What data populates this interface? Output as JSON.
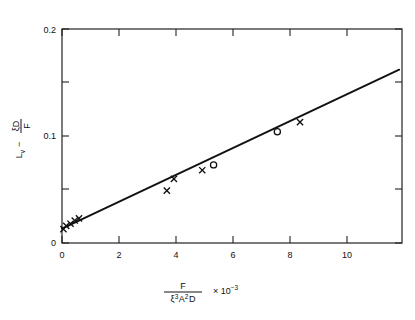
{
  "chart_data": {
    "type": "scatter",
    "title": "",
    "subtitle": "",
    "xlabel": "F / (ξ³A²D)  × 10⁻³",
    "ylabel": "L_v − ξD/F",
    "xlabel_parts": {
      "numerator": "F",
      "denominator_xi": "ξ",
      "denominator_xi_exp": "3",
      "denominator_A": "A",
      "denominator_A_exp": "2",
      "denominator_D": "D",
      "multiplier": "× 10",
      "multiplier_exp": "−3"
    },
    "ylabel_parts": {
      "lead": "L",
      "lead_sub": "v",
      "minus": "−",
      "frac_num_xi": "ξ",
      "frac_num_D": "D",
      "frac_den": "F"
    },
    "xlim": [
      0,
      12
    ],
    "ylim": [
      0,
      0.2
    ],
    "xticks": [
      0,
      2,
      4,
      6,
      8,
      10
    ],
    "xticklabels": [
      "0",
      "2",
      "4",
      "6",
      "8",
      "10"
    ],
    "xticks_minor": [
      1,
      3,
      5,
      7,
      9,
      11
    ],
    "yticks": [
      0,
      0.1,
      0.2
    ],
    "yticklabels": [
      "0",
      "0.1",
      "0.2"
    ],
    "yticks_minor": [
      0.05,
      0.15
    ],
    "grid": false,
    "legend": false,
    "frame": true,
    "series": [
      {
        "name": "cross-markers",
        "marker": "x",
        "color": "#111111",
        "points": [
          {
            "x": 0.05,
            "y": 0.013
          },
          {
            "x": 0.15,
            "y": 0.016
          },
          {
            "x": 0.3,
            "y": 0.018
          },
          {
            "x": 0.45,
            "y": 0.021
          },
          {
            "x": 0.6,
            "y": 0.023
          },
          {
            "x": 3.7,
            "y": 0.049
          },
          {
            "x": 3.95,
            "y": 0.06
          },
          {
            "x": 4.95,
            "y": 0.068
          },
          {
            "x": 8.4,
            "y": 0.113
          }
        ]
      },
      {
        "name": "open-circle-markers",
        "marker": "o",
        "color": "#111111",
        "points": [
          {
            "x": 5.35,
            "y": 0.073
          },
          {
            "x": 7.6,
            "y": 0.104
          }
        ]
      }
    ],
    "fit_line": {
      "name": "linear-fit",
      "x0": 0.0,
      "y0": 0.0135,
      "x1": 11.9,
      "y1": 0.162,
      "slope": 0.01248,
      "intercept": 0.0135
    }
  }
}
